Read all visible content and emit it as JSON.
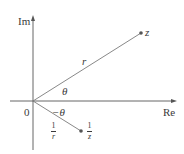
{
  "diagram": {
    "type": "complex-plane",
    "colors": {
      "axis": "#555555",
      "line": "#7a7a7a",
      "point": "#555555",
      "text": "#3a3a3a"
    },
    "axes": {
      "vertical_label": "Im",
      "horizontal_label": "Re",
      "origin_label": "0"
    },
    "points": [
      {
        "id": "z",
        "label": "z"
      },
      {
        "id": "inv_z",
        "label_num": "1",
        "label_den": "z"
      }
    ],
    "segments": [
      {
        "id": "r",
        "label": "r"
      },
      {
        "id": "inv_r",
        "label_num": "1",
        "label_den": "r"
      }
    ],
    "angles": [
      {
        "id": "theta",
        "label": "θ"
      },
      {
        "id": "neg_theta",
        "label": "−θ"
      }
    ]
  }
}
